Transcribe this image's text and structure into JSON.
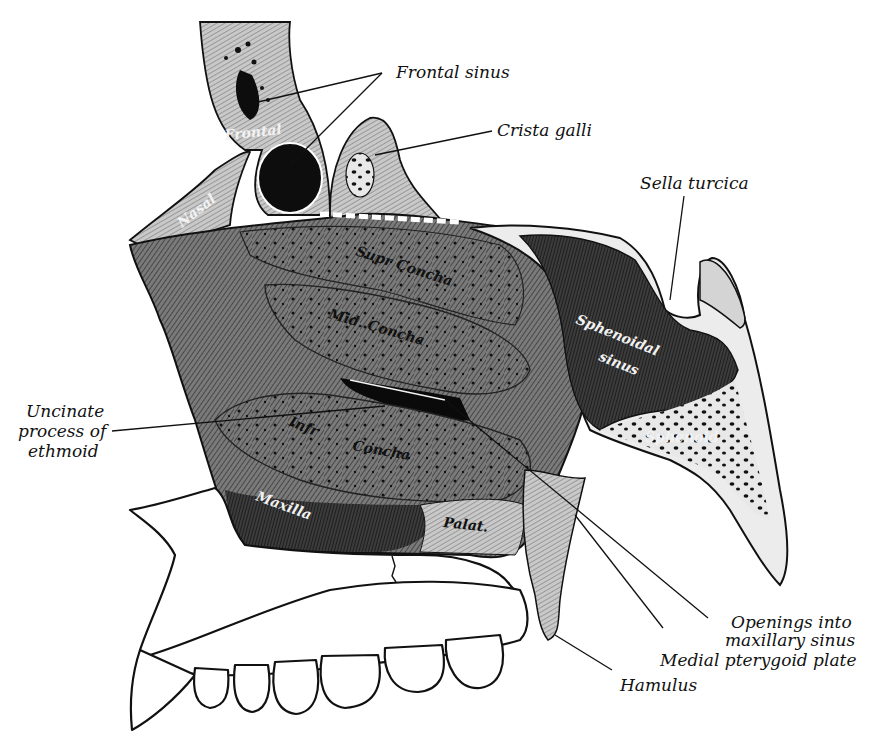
{
  "figure": {
    "style": "black-and-white anatomical engraving",
    "external_labels": [
      {
        "id": "frontal-sinus",
        "text": "Frontal sinus"
      },
      {
        "id": "crista-galli",
        "text": "Crista galli"
      },
      {
        "id": "sella-turcica",
        "text": "Sella turcica"
      },
      {
        "id": "uncinate-1",
        "text": "Uncinate"
      },
      {
        "id": "uncinate-2",
        "text": "process of"
      },
      {
        "id": "uncinate-3",
        "text": "ethmoid"
      },
      {
        "id": "openings-1",
        "text": "Openings into"
      },
      {
        "id": "openings-2",
        "text": "maxillary sinus"
      },
      {
        "id": "medial-pterygoid",
        "text": "Medial pterygoid plate"
      },
      {
        "id": "hamulus",
        "text": "Hamulus"
      }
    ],
    "internal_labels": {
      "frontal": "Frontal",
      "nasal": "Nasal",
      "supr_concha": "Supr Concha",
      "mid_concha": "Mid. Concha",
      "infr": "Infr",
      "concha": "Concha",
      "sphenoidal": "Sphenoidal",
      "sinus": "sinus",
      "sphenoid": "Sphenoid",
      "maxilla": "Maxilla",
      "palat": "Palat."
    },
    "colors": {
      "ink": "#111111",
      "paper": "#ffffff",
      "mid_tone": "#6e6e6e",
      "dark_tone": "#2a2a2a",
      "light_tone": "#bdbdbd"
    }
  }
}
